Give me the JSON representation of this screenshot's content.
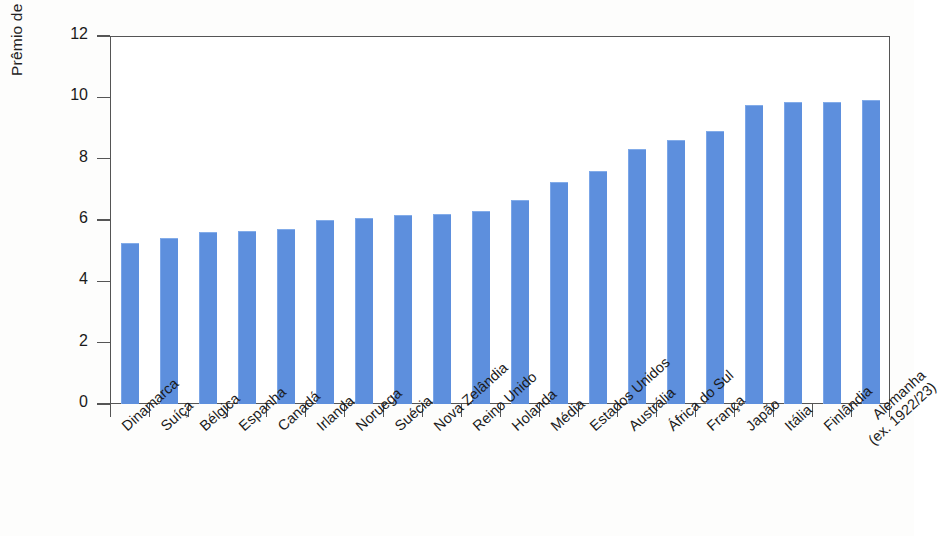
{
  "chart_data": {
    "type": "bar",
    "title": "",
    "subtitle": "",
    "xlabel": "",
    "ylabel": "Prêmio de risco (%)",
    "ylim": [
      0,
      12
    ],
    "yticks": [
      0,
      2,
      4,
      6,
      8,
      10,
      12
    ],
    "ytick_labels": [
      "0",
      "2",
      "4",
      "6",
      "8",
      "10",
      "12"
    ],
    "grid": false,
    "legend": "none",
    "bar_color": "#5d8fdd",
    "axis_color": "#555555",
    "categories": [
      "Dinamarca",
      "Suíça",
      "Bélgica",
      "Espanha",
      "Canadá",
      "Irlanda",
      "Noruega",
      "Suécia",
      "Nova Zelândia",
      "Reino Unido",
      "Holanda",
      "Média",
      "Estados Unidos",
      "Austrália",
      "África do Sul",
      "França",
      "Japão",
      "Itália",
      "Finlândia",
      "Alemanha"
    ],
    "category_sublabels": [
      "",
      "",
      "",
      "",
      "",
      "",
      "",
      "",
      "",
      "",
      "",
      "",
      "",
      "",
      "",
      "",
      "",
      "",
      "",
      "(ex. 1922/23)"
    ],
    "values": [
      5.25,
      5.4,
      5.6,
      5.65,
      5.7,
      6.0,
      6.05,
      6.15,
      6.2,
      6.3,
      6.65,
      7.25,
      7.6,
      8.3,
      8.6,
      8.9,
      9.75,
      9.85,
      9.85,
      9.9
    ],
    "units": "%"
  }
}
